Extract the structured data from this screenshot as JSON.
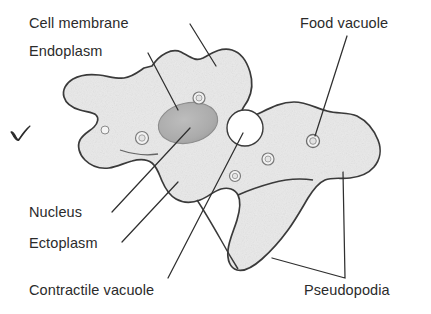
{
  "diagram": {
    "background_color": "#ffffff",
    "outline_color": "#3a3a3a",
    "cytoplasm_fill": "#e6e6e6",
    "nucleus_fill": "#b0b0b0",
    "contractile_vacuole_fill": "#ffffff",
    "label_color": "#2b2b2b"
  },
  "labels": {
    "cell_membrane": "Cell membrane",
    "endoplasm": "Endoplasm",
    "food_vacuole": "Food vacuole",
    "nucleus": "Nucleus",
    "ectoplasm": "Ectoplasm",
    "contractile_vacuole": "Contractile vacuole",
    "pseudopodia": "Pseudopodia"
  },
  "marks": {
    "check": "check-mark"
  },
  "structures": [
    {
      "name": "cell-membrane",
      "label": "Cell membrane"
    },
    {
      "name": "endoplasm",
      "label": "Endoplasm"
    },
    {
      "name": "food-vacuole",
      "label": "Food vacuole"
    },
    {
      "name": "nucleus",
      "label": "Nucleus"
    },
    {
      "name": "ectoplasm",
      "label": "Ectoplasm"
    },
    {
      "name": "contractile-vacuole",
      "label": "Contractile vacuole"
    },
    {
      "name": "pseudopodia",
      "label": "Pseudopodia"
    }
  ]
}
